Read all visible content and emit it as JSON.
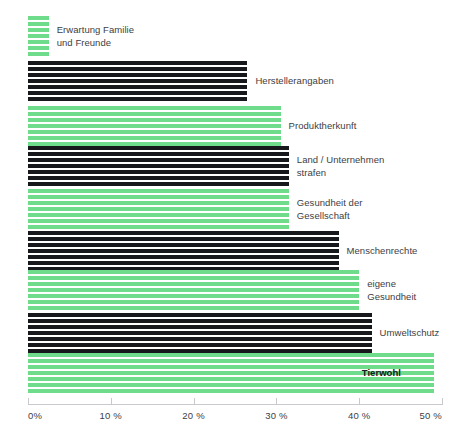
{
  "chart_data": {
    "type": "bar",
    "orientation": "horizontal",
    "title": "",
    "subtitle": "",
    "xlabel": "",
    "ylabel": "",
    "xlim": [
      0,
      50
    ],
    "xunit": "%",
    "grid": false,
    "legend": "none",
    "tick_labels": [
      "0%",
      "10 %",
      "20 %",
      "30 %",
      "40 %",
      "50 %"
    ],
    "tick_values": [
      0,
      10,
      20,
      30,
      40,
      50
    ],
    "categories": [
      "Erwartung Familie und Freunde",
      "Herstellerangaben",
      "Produktherkunft",
      "Land / Unternehmen strafen",
      "Gesundheit der Gesellschaft",
      "Menschenrechte",
      "eigene Gesundheit",
      "Umweltschutz",
      "Tierwohl"
    ],
    "values": [
      2.5,
      26.5,
      30.5,
      31.5,
      31.5,
      37.5,
      40,
      41.5,
      49
    ],
    "colors": [
      "#6fdc8c",
      "#17181c",
      "#6fdc8c",
      "#17181c",
      "#6fdc8c",
      "#17181c",
      "#6fdc8c",
      "#17181c",
      "#6fdc8c"
    ]
  },
  "bars": [
    {
      "label": "Erwartung Familie\nund Freunde",
      "value": 2.5,
      "color_key": "green",
      "top": 16,
      "height": 41,
      "label_inside": false
    },
    {
      "label": "Herstellerangaben",
      "value": 26.5,
      "color_key": "black",
      "top": 61,
      "height": 41,
      "label_inside": false
    },
    {
      "label": "Produktherkunft",
      "value": 30.5,
      "color_key": "green",
      "top": 106,
      "height": 41,
      "label_inside": false
    },
    {
      "label": "Land / Unternehmen\nstrafen",
      "value": 31.5,
      "color_key": "black",
      "top": 146,
      "height": 41,
      "label_inside": false
    },
    {
      "label": "Gesundheit der\nGesellschaft",
      "value": 31.5,
      "color_key": "green",
      "top": 189,
      "height": 41,
      "label_inside": false
    },
    {
      "label": "Menschenrechte",
      "value": 37.5,
      "color_key": "black",
      "top": 231,
      "height": 41,
      "label_inside": false
    },
    {
      "label": "eigene\nGesundheit",
      "value": 40,
      "color_key": "green",
      "top": 270,
      "height": 41,
      "label_inside": false
    },
    {
      "label": "Umweltschutz",
      "value": 41.5,
      "color_key": "black",
      "top": 313,
      "height": 41,
      "label_inside": false
    },
    {
      "label": "Tierwohl",
      "value": 49,
      "color_key": "green",
      "top": 353,
      "height": 41,
      "label_inside": true
    }
  ],
  "axis": {
    "origin_px": 28,
    "end_px": 442,
    "ticks": [
      {
        "label": "0%",
        "value": 0,
        "pos": 28,
        "align": "first"
      },
      {
        "label": "10 %",
        "value": 10,
        "pos": 110.8,
        "align": "mid"
      },
      {
        "label": "20 %",
        "value": 20,
        "pos": 193.6,
        "align": "mid"
      },
      {
        "label": "30 %",
        "value": 30,
        "pos": 276.4,
        "align": "mid"
      },
      {
        "label": "40 %",
        "value": 40,
        "pos": 359.2,
        "align": "mid"
      },
      {
        "label": "50 %",
        "value": 50,
        "pos": 442,
        "align": "last"
      }
    ]
  },
  "colors": {
    "green": "#6fdc8c",
    "black": "#17181c",
    "axis": "#c9c8cd",
    "text": "#3d4044",
    "background": "#ffffff"
  }
}
